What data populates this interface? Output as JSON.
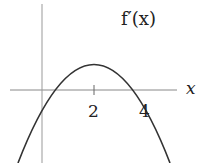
{
  "diagram": {
    "function_label": "f′(x)",
    "x_axis_label": "x",
    "tick_labels": [
      "2",
      "4"
    ],
    "curve": {
      "type": "parabola",
      "roots": [
        0,
        4
      ],
      "vertex": [
        2,
        "max"
      ]
    },
    "colors": {
      "curve": "#333333",
      "axis": "#888888",
      "text": "#222222"
    }
  }
}
